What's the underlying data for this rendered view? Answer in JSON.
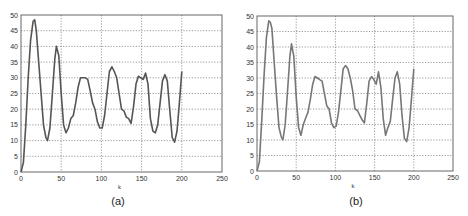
{
  "colors": {
    "curve_a": "#555555",
    "curve_b": "#777777",
    "frame": "#666666",
    "grid": "#555555"
  },
  "chart_data": [
    {
      "type": "line",
      "caption": "(a)",
      "xlabel": "k",
      "ylabel": "",
      "xlim": [
        0,
        250
      ],
      "ylim": [
        0,
        50
      ],
      "xticks": [
        0,
        50,
        100,
        150,
        200,
        250
      ],
      "yticks": [
        0,
        5,
        10,
        15,
        20,
        25,
        30,
        35,
        40,
        45,
        50
      ],
      "grid": true,
      "series": [
        {
          "name": "a",
          "x": [
            0,
            3,
            6,
            9,
            12,
            15,
            17,
            19,
            22,
            25,
            28,
            31,
            33,
            36,
            39,
            42,
            44,
            47,
            50,
            53,
            56,
            59,
            62,
            65,
            68,
            71,
            74,
            77,
            80,
            83,
            86,
            89,
            92,
            95,
            98,
            101,
            104,
            107,
            110,
            113,
            116,
            119,
            122,
            125,
            128,
            131,
            134,
            137,
            140,
            143,
            146,
            149,
            152,
            155,
            158,
            161,
            164,
            167,
            170,
            173,
            176,
            179,
            182,
            185,
            188,
            191,
            194,
            197,
            200
          ],
          "y": [
            0,
            3,
            15,
            30,
            42,
            48,
            48.5,
            45,
            35,
            25,
            15,
            11,
            10,
            14,
            25,
            36,
            40,
            37,
            25,
            15,
            12.5,
            14,
            17,
            18,
            22,
            27,
            30,
            30,
            30,
            29.5,
            26,
            22,
            20,
            16,
            14,
            14,
            18,
            25,
            32,
            33.5,
            32,
            30,
            25,
            20,
            19.5,
            17.5,
            17,
            15.5,
            21,
            28,
            30.5,
            30,
            29.5,
            31.5,
            28,
            17,
            13,
            12.5,
            15,
            22,
            29,
            31,
            29,
            20,
            11,
            9.5,
            13,
            22,
            32
          ]
        }
      ]
    },
    {
      "type": "line",
      "caption": "(b)",
      "xlabel": "k",
      "ylabel": "",
      "xlim": [
        0,
        250
      ],
      "ylim": [
        0,
        50
      ],
      "xticks": [
        0,
        50,
        100,
        150,
        200,
        250
      ],
      "yticks": [
        0,
        5,
        10,
        15,
        20,
        25,
        30,
        35,
        40,
        45,
        50
      ],
      "grid": true,
      "series": [
        {
          "name": "b",
          "x": [
            0,
            3,
            6,
            9,
            12,
            15,
            17,
            19,
            22,
            25,
            28,
            31,
            33,
            36,
            39,
            42,
            44,
            47,
            50,
            53,
            56,
            59,
            62,
            65,
            68,
            71,
            74,
            77,
            80,
            83,
            86,
            89,
            92,
            95,
            98,
            101,
            104,
            107,
            110,
            113,
            116,
            119,
            122,
            125,
            128,
            131,
            134,
            137,
            140,
            143,
            146,
            149,
            152,
            155,
            158,
            161,
            164,
            167,
            170,
            173,
            176,
            179,
            182,
            185,
            188,
            191,
            194,
            197,
            200
          ],
          "y": [
            0,
            3,
            16,
            31,
            43,
            48.5,
            48,
            46,
            35,
            24,
            14,
            11,
            10,
            15,
            26,
            37,
            41,
            37,
            24,
            14,
            11.5,
            15,
            17,
            19,
            23,
            28,
            30.5,
            30,
            29.5,
            29,
            25,
            21,
            20,
            15.5,
            14,
            14.5,
            19,
            26,
            33,
            34,
            33,
            30,
            26,
            20,
            19.5,
            18,
            16.5,
            15.5,
            22,
            29,
            30.5,
            29.5,
            28,
            32,
            27,
            17,
            11.5,
            14,
            16,
            23,
            30,
            32,
            28,
            18,
            10.5,
            9.5,
            14,
            23,
            33
          ]
        }
      ]
    }
  ]
}
